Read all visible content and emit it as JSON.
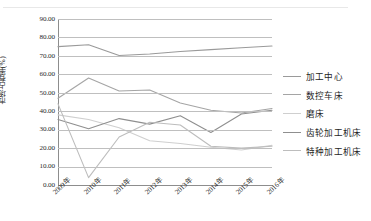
{
  "chart_data": {
    "type": "line",
    "title": "",
    "xlabel": "",
    "ylabel": "市场占有率(%)",
    "ylim": [
      0,
      90
    ],
    "ytick_step": 10,
    "grid": true,
    "legend_position": "right",
    "categories": [
      "2009年",
      "2010年",
      "2011年",
      "2012年",
      "2013年",
      "2014年",
      "2015年",
      "2016年"
    ],
    "ytick_labels": [
      "0.00",
      "10.00",
      "20.00",
      "30.00",
      "40.00",
      "50.00",
      "60.00",
      "70.00",
      "80.00",
      "90.00"
    ],
    "series": [
      {
        "name": "加工中心",
        "color": "#9a9a9a",
        "values": [
          75.0,
          76.0,
          70.2,
          71.0,
          72.4,
          73.4,
          74.4,
          75.4
        ]
      },
      {
        "name": "数控车床",
        "color": "#a5a5a5",
        "values": [
          47.0,
          58.0,
          51.0,
          51.5,
          44.5,
          40.5,
          39.0,
          41.5
        ]
      },
      {
        "name": "磨床",
        "color": "#cfcfcf",
        "values": [
          38.0,
          35.5,
          31.0,
          24.0,
          22.5,
          20.5,
          19.0,
          21.5
        ]
      },
      {
        "name": "齿轮加工机床",
        "color": "#8f8f8f",
        "values": [
          35.5,
          30.5,
          36.0,
          33.0,
          37.5,
          28.5,
          38.5,
          40.5
        ]
      },
      {
        "name": "特种加工机床",
        "color": "#bdbdbd",
        "values": [
          44.0,
          4.0,
          26.0,
          34.0,
          32.5,
          21.0,
          20.0,
          21.0
        ]
      }
    ]
  },
  "legend": {
    "items": [
      {
        "label": "加工中心"
      },
      {
        "label": "数控车床"
      },
      {
        "label": "磨床"
      },
      {
        "label": "齿轮加工机床"
      },
      {
        "label": "特种加工机床"
      }
    ]
  }
}
